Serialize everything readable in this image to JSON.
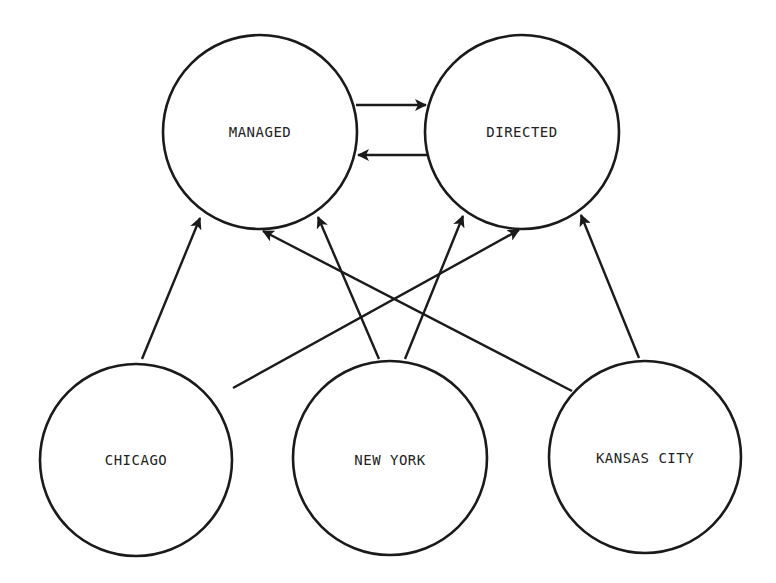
{
  "diagram": {
    "type": "directed-graph",
    "nodes": [
      {
        "id": "managed",
        "label": "MANAGED",
        "cx": 260,
        "cy": 132,
        "r": 97
      },
      {
        "id": "directed",
        "label": "DIRECTED",
        "cx": 522,
        "cy": 132,
        "r": 97
      },
      {
        "id": "chicago",
        "label": "CHICAGO",
        "cx": 136,
        "cy": 460,
        "r": 96
      },
      {
        "id": "new_york",
        "label": "NEW YORK",
        "cx": 390,
        "cy": 458,
        "r": 97
      },
      {
        "id": "kansas_city",
        "label": "KANSAS CITY",
        "cx": 645,
        "cy": 457,
        "r": 96
      }
    ],
    "edges": [
      {
        "from": "managed",
        "to": "directed",
        "x1": 356,
        "y1": 105,
        "x2": 426,
        "y2": 105
      },
      {
        "from": "directed",
        "to": "managed",
        "x1": 428,
        "y1": 155,
        "x2": 358,
        "y2": 155
      },
      {
        "from": "chicago",
        "to": "managed",
        "x1": 142,
        "y1": 359,
        "x2": 200,
        "y2": 218
      },
      {
        "from": "new_york",
        "to": "managed",
        "x1": 379,
        "y1": 359,
        "x2": 318,
        "y2": 217
      },
      {
        "from": "kansas_city",
        "to": "managed",
        "x1": 572,
        "y1": 391,
        "x2": 263,
        "y2": 231
      },
      {
        "from": "new_york",
        "to": "directed",
        "x1": 405,
        "y1": 359,
        "x2": 463,
        "y2": 216
      },
      {
        "from": "chicago",
        "to": "directed",
        "x1": 233,
        "y1": 388,
        "x2": 519,
        "y2": 230
      },
      {
        "from": "kansas_city",
        "to": "directed",
        "x1": 639,
        "y1": 358,
        "x2": 581,
        "y2": 215
      }
    ]
  },
  "labels": {
    "managed": "MANAGED",
    "directed": "DIRECTED",
    "chicago": "CHICAGO",
    "new_york": "NEW YORK",
    "kansas_city": "KANSAS CITY"
  }
}
